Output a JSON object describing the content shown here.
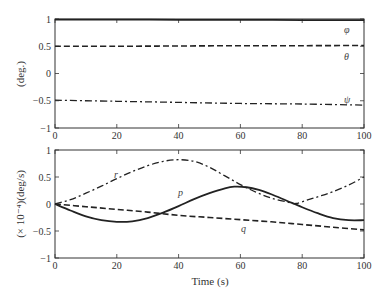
{
  "chart_data": [
    {
      "type": "line",
      "title": "",
      "xlabel": "",
      "ylabel": "(deg.)",
      "xlim": [
        0,
        100
      ],
      "ylim": [
        -1,
        1
      ],
      "xticks": [
        0,
        20,
        40,
        60,
        80,
        100
      ],
      "yticks": [
        1,
        0.5,
        0,
        -0.5,
        -1
      ],
      "ytick_labels": [
        "1",
        "0.5",
        "0",
        "−0.5",
        "−1"
      ],
      "grid": false,
      "series": [
        {
          "name": "φ",
          "style": "solid",
          "x": [
            0,
            20,
            40,
            60,
            80,
            100
          ],
          "y": [
            0.99,
            0.99,
            0.985,
            0.985,
            0.98,
            0.98
          ]
        },
        {
          "name": "θ",
          "style": "dashed",
          "x": [
            0,
            20,
            40,
            60,
            80,
            100
          ],
          "y": [
            0.5,
            0.5,
            0.505,
            0.51,
            0.51,
            0.515
          ]
        },
        {
          "name": "ψ",
          "style": "dashdot",
          "x": [
            0,
            20,
            40,
            60,
            80,
            100
          ],
          "y": [
            -0.49,
            -0.51,
            -0.53,
            -0.55,
            -0.56,
            -0.58
          ]
        }
      ]
    },
    {
      "type": "line",
      "title": "",
      "xlabel": "Time (s)",
      "ylabel": "(× 10⁻⁴)(deg/s)",
      "xlim": [
        0,
        100
      ],
      "ylim": [
        -1,
        1
      ],
      "xticks": [
        0,
        20,
        40,
        60,
        80,
        100
      ],
      "yticks": [
        1,
        0.5,
        0,
        -0.5,
        -1
      ],
      "ytick_labels": [
        "1",
        "0.5",
        "0",
        "−0.5",
        "−1"
      ],
      "grid": false,
      "series": [
        {
          "name": "p",
          "style": "solid",
          "x": [
            0,
            5,
            10,
            15,
            20,
            25,
            30,
            35,
            40,
            45,
            50,
            55,
            58,
            62,
            66,
            70,
            75,
            80,
            85,
            90,
            95,
            100
          ],
          "y": [
            0,
            -0.12,
            -0.23,
            -0.3,
            -0.33,
            -0.32,
            -0.26,
            -0.16,
            -0.04,
            0.09,
            0.2,
            0.29,
            0.32,
            0.31,
            0.26,
            0.18,
            0.06,
            -0.06,
            -0.17,
            -0.26,
            -0.3,
            -0.3
          ]
        },
        {
          "name": "r",
          "style": "dashdot",
          "x": [
            0,
            5,
            10,
            15,
            20,
            25,
            30,
            35,
            40,
            45,
            50,
            55,
            60,
            65,
            70,
            75,
            78,
            82,
            86,
            90,
            95,
            100
          ],
          "y": [
            0,
            0.08,
            0.2,
            0.33,
            0.47,
            0.6,
            0.71,
            0.79,
            0.82,
            0.79,
            0.68,
            0.52,
            0.36,
            0.22,
            0.11,
            0.04,
            0.01,
            0.08,
            0.15,
            0.23,
            0.35,
            0.5
          ]
        },
        {
          "name": "q",
          "style": "dashed",
          "x": [
            0,
            10,
            20,
            30,
            40,
            50,
            60,
            70,
            80,
            90,
            100
          ],
          "y": [
            0,
            -0.05,
            -0.1,
            -0.15,
            -0.21,
            -0.25,
            -0.29,
            -0.33,
            -0.38,
            -0.43,
            -0.48
          ]
        }
      ]
    }
  ],
  "labels": {
    "top_series": {
      "phi": "φ",
      "theta": "θ",
      "psi": "ψ"
    },
    "bottom_series": {
      "r": "r",
      "p": "p",
      "q": "q"
    }
  }
}
